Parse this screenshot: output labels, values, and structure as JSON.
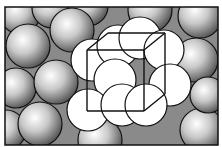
{
  "diagram": {
    "title": "",
    "frame": {
      "x": 5,
      "y": 7,
      "width": 213,
      "height": 138
    },
    "colors": {
      "background": "#ffffff",
      "outline": "#111111",
      "sphere_light": "#ffffff",
      "sphere_mid": "#c8c8c8",
      "sphere_dark": "#4a4a4a",
      "unit_cell_sphere": "#ffffff"
    },
    "gray_spheres": [
      {
        "cx": 20,
        "cy": 14,
        "r": 20
      },
      {
        "cx": 52,
        "cy": 8,
        "r": 20
      },
      {
        "cx": 88,
        "cy": 6,
        "r": 20
      },
      {
        "cx": 150,
        "cy": 10,
        "r": 22
      },
      {
        "cx": 200,
        "cy": 16,
        "r": 22
      },
      {
        "cx": 28,
        "cy": 46,
        "r": 22
      },
      {
        "cx": 72,
        "cy": 30,
        "r": 22
      },
      {
        "cx": 196,
        "cy": 60,
        "r": 22
      },
      {
        "cx": 16,
        "cy": 88,
        "r": 20
      },
      {
        "cx": 56,
        "cy": 82,
        "r": 22
      },
      {
        "cx": 6,
        "cy": 130,
        "r": 20
      },
      {
        "cx": 40,
        "cy": 124,
        "r": 22
      },
      {
        "cx": 100,
        "cy": 140,
        "r": 22
      },
      {
        "cx": 202,
        "cy": 130,
        "r": 22
      },
      {
        "cx": 208,
        "cy": 95,
        "r": 18
      }
    ],
    "white_spheres": [
      {
        "cx": 92,
        "cy": 60,
        "r": 21
      },
      {
        "cx": 118,
        "cy": 46,
        "r": 21
      },
      {
        "cx": 140,
        "cy": 38,
        "r": 21
      },
      {
        "cx": 164,
        "cy": 50,
        "r": 20
      },
      {
        "cx": 115,
        "cy": 80,
        "r": 21
      },
      {
        "cx": 170,
        "cy": 85,
        "r": 21
      },
      {
        "cx": 88,
        "cy": 110,
        "r": 21
      },
      {
        "cx": 122,
        "cy": 105,
        "r": 21
      },
      {
        "cx": 146,
        "cy": 105,
        "r": 21
      }
    ],
    "unit_cell": {
      "front_face": {
        "x1": 87,
        "y1": 50,
        "x2": 144,
        "y2": 111
      },
      "offset": {
        "dx": 21,
        "dy": -17
      }
    }
  }
}
